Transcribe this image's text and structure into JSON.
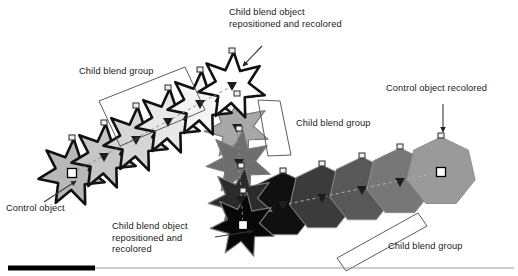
{
  "figure": {
    "width": 518,
    "height": 276,
    "background": "#ffffff"
  },
  "callouts": [
    {
      "id": "child-blend-object-top",
      "text": "Child blend object\nrepositioned and recolored"
    },
    {
      "id": "child-blend-group-left",
      "text": "Child blend group"
    },
    {
      "id": "child-blend-group-mid",
      "text": "Child blend group"
    },
    {
      "id": "control-object-recolored",
      "text": "Control object recolored"
    },
    {
      "id": "control-object",
      "text": "Control object"
    },
    {
      "id": "child-blend-object-bottom",
      "text": "Child blend object\nrepositioned and\nrecolored"
    },
    {
      "id": "child-blend-group-bottom",
      "text": "Child blend group"
    }
  ],
  "colors": {
    "text": "#1a1a1a",
    "outline_dark": "#111111",
    "outline_mid": "#555555",
    "leader": "#3a3a3a",
    "rule": "#9a9a9a",
    "rule_accent": "#000000",
    "marker_fill": "#ffffff",
    "marker_stroke": "#000000",
    "dashed_spine": "#8c8c8c"
  },
  "star_chain": {
    "label": "diagonal star blend: control object to child blend object",
    "shapes": [
      {
        "name": "star-control-object",
        "cx": 72,
        "cy": 173,
        "r": 34,
        "fill": "#b8b8b8",
        "marker": "square"
      },
      {
        "name": "star-step-1",
        "cx": 104,
        "cy": 157,
        "r": 33,
        "fill": "#c6c6c6",
        "marker": "triangle"
      },
      {
        "name": "star-step-2",
        "cx": 136,
        "cy": 140,
        "r": 33,
        "fill": "#d6d6d6",
        "marker": "triangle"
      },
      {
        "name": "star-step-3",
        "cx": 168,
        "cy": 122,
        "r": 33,
        "fill": "#e8e8e8",
        "marker": "triangle"
      },
      {
        "name": "star-step-4",
        "cx": 200,
        "cy": 104,
        "r": 33,
        "fill": "#f4f4f4",
        "marker": "triangle"
      },
      {
        "name": "star-child-top",
        "cx": 232,
        "cy": 86,
        "r": 34,
        "fill": "#ffffff",
        "marker": "triangle"
      }
    ]
  },
  "vertical_chain": {
    "label": "vertical star blend descending from white star to black star",
    "shapes": [
      {
        "name": "star-vert-1",
        "cx": 237,
        "cy": 128,
        "r": 33,
        "fill": "#a8a8a8",
        "marker": "triangle"
      },
      {
        "name": "star-vert-2",
        "cx": 239,
        "cy": 163,
        "r": 33,
        "fill": "#6e6e6e",
        "marker": "triangle"
      },
      {
        "name": "star-vert-3",
        "cx": 241,
        "cy": 200,
        "r": 33,
        "fill": "#2b2b2b",
        "marker": "triangle"
      },
      {
        "name": "star-vert-4",
        "cx": 243,
        "cy": 225,
        "r": 33,
        "fill": "#080808",
        "marker": "square"
      }
    ]
  },
  "heptagon_chain": {
    "label": "horizontal heptagon blend from black to light gray control object",
    "shapes": [
      {
        "name": "heptagon-1",
        "cx": 283,
        "cy": 205,
        "r": 33,
        "fill": "#101010",
        "marker": "triangle"
      },
      {
        "name": "heptagon-2",
        "cx": 322,
        "cy": 198,
        "r": 33,
        "fill": "#3b3b3b",
        "marker": "triangle"
      },
      {
        "name": "heptagon-3",
        "cx": 362,
        "cy": 190,
        "r": 33,
        "fill": "#585858",
        "marker": "triangle"
      },
      {
        "name": "heptagon-4",
        "cx": 400,
        "cy": 182,
        "r": 34,
        "fill": "#777777",
        "marker": "triangle"
      },
      {
        "name": "heptagon-control",
        "cx": 441,
        "cy": 172,
        "r": 35,
        "fill": "#9a9a9a",
        "marker": "square"
      }
    ]
  },
  "brackets": [
    {
      "name": "bracket-child-blend-group-left",
      "points": "99,101 185,67 205,110 120,146"
    },
    {
      "name": "bracket-child-blend-group-mid",
      "points": "258,100 280,101 291,155 268,156"
    },
    {
      "name": "bracket-child-blend-group-bottom",
      "points": "337,258 418,213 427,226 346,271"
    }
  ],
  "leaders": [
    {
      "name": "leader-child-blend-object-top",
      "x1": 262,
      "y1": 46,
      "x2": 243,
      "y2": 66
    },
    {
      "name": "leader-control-object-recolored",
      "x1": 443,
      "y1": 104,
      "x2": 443,
      "y2": 132
    },
    {
      "name": "leader-control-object",
      "x1": 44,
      "y1": 202,
      "x2": 76,
      "y2": 181
    },
    {
      "name": "leader-child-blend-object-bottom",
      "x1": 215,
      "y1": 237,
      "x2": 253,
      "y2": 231
    }
  ],
  "bottom_rule": {
    "name": "footer-rule",
    "y": 268,
    "accent_from": 8,
    "accent_to": 95,
    "line_to": 514
  }
}
